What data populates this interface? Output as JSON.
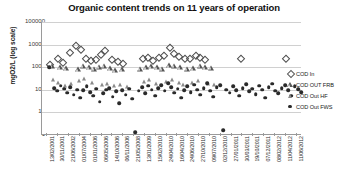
{
  "chart_data": {
    "type": "scatter",
    "title": "Organic content trends on 11 years of operation",
    "xlabel": "",
    "ylabel": "mgO2/L (log scale)",
    "yscale": "log",
    "ylim": [
      1,
      100000
    ],
    "ytick_labels": [
      "100000",
      "10000",
      "1000",
      "100",
      "10",
      "1"
    ],
    "ytick_values": [
      100000,
      10000,
      1000,
      100,
      10,
      1
    ],
    "grid": true,
    "legend_position": "right",
    "categories": [
      "13/02/2001",
      "30/11/2001",
      "21/06/2002",
      "01/07/2004",
      "01/01/2006",
      "06/05/2006",
      "14/10/2006",
      "06/11/2006",
      "21/05/2008",
      "13/01/2009",
      "15/02/2010",
      "24/04/2010",
      "16/04/2010",
      "24/06/2010",
      "27/10/2010",
      "09/07/2010",
      "02/12/2010",
      "27/01/2011",
      "30/03/2011",
      "19/10/2011",
      "07/12/2011",
      "08/02/2012",
      "11/04/2012",
      "11/06/2012"
    ],
    "series": [
      {
        "name": "COD In",
        "marker": "open-diamond",
        "color": "#4d4d4d",
        "points": [
          {
            "x": 1.0,
            "y": 1200
          },
          {
            "x": 2.0,
            "y": 2300
          },
          {
            "x": 2.6,
            "y": 1500
          },
          {
            "x": 3.4,
            "y": 4200
          },
          {
            "x": 4.2,
            "y": 9000
          },
          {
            "x": 4.8,
            "y": 6000
          },
          {
            "x": 5.4,
            "y": 2400
          },
          {
            "x": 6.0,
            "y": 1800
          },
          {
            "x": 6.6,
            "y": 2000
          },
          {
            "x": 7.2,
            "y": 3400
          },
          {
            "x": 7.8,
            "y": 5200
          },
          {
            "x": 8.6,
            "y": 2100
          },
          {
            "x": 9.4,
            "y": 1700
          },
          {
            "x": 10.0,
            "y": 1450
          },
          {
            "x": 12.4,
            "y": 2200
          },
          {
            "x": 13.0,
            "y": 2600
          },
          {
            "x": 13.6,
            "y": 1900
          },
          {
            "x": 14.4,
            "y": 2500
          },
          {
            "x": 15.0,
            "y": 3100
          },
          {
            "x": 15.8,
            "y": 7000
          },
          {
            "x": 16.3,
            "y": 4000
          },
          {
            "x": 16.9,
            "y": 2800
          },
          {
            "x": 17.6,
            "y": 2400
          },
          {
            "x": 18.2,
            "y": 2200
          },
          {
            "x": 19.0,
            "y": 3000
          },
          {
            "x": 19.5,
            "y": 2600
          },
          {
            "x": 20.1,
            "y": 2100
          },
          {
            "x": 24.5,
            "y": 2300
          },
          {
            "x": 30.0,
            "y": 2300
          }
        ]
      },
      {
        "name": "COD OUT FRB",
        "marker": "open-triangle",
        "color": "#555555",
        "points": [
          {
            "x": 1.2,
            "y": 700
          },
          {
            "x": 2.2,
            "y": 620
          },
          {
            "x": 3.0,
            "y": 560
          },
          {
            "x": 4.4,
            "y": 480
          },
          {
            "x": 5.0,
            "y": 700
          },
          {
            "x": 5.8,
            "y": 600
          },
          {
            "x": 6.4,
            "y": 520
          },
          {
            "x": 7.0,
            "y": 640
          },
          {
            "x": 7.6,
            "y": 700
          },
          {
            "x": 8.4,
            "y": 560
          },
          {
            "x": 9.0,
            "y": 430
          },
          {
            "x": 9.8,
            "y": 500
          },
          {
            "x": 12.0,
            "y": 520
          },
          {
            "x": 12.8,
            "y": 600
          },
          {
            "x": 13.4,
            "y": 680
          },
          {
            "x": 14.2,
            "y": 620
          },
          {
            "x": 14.8,
            "y": 520
          },
          {
            "x": 15.6,
            "y": 760
          },
          {
            "x": 16.2,
            "y": 700
          },
          {
            "x": 17.0,
            "y": 600
          },
          {
            "x": 17.8,
            "y": 520
          },
          {
            "x": 18.6,
            "y": 560
          },
          {
            "x": 19.4,
            "y": 700
          },
          {
            "x": 20.0,
            "y": 620
          },
          {
            "x": 20.8,
            "y": 580
          }
        ]
      },
      {
        "name": "COD Out HF",
        "marker": "filled-triangle",
        "color": "#8a8a8a",
        "points": [
          {
            "x": 1.4,
            "y": 260
          },
          {
            "x": 2.0,
            "y": 200
          },
          {
            "x": 2.8,
            "y": 150
          },
          {
            "x": 3.6,
            "y": 180
          },
          {
            "x": 4.6,
            "y": 240
          },
          {
            "x": 5.2,
            "y": 300
          },
          {
            "x": 6.2,
            "y": 210
          },
          {
            "x": 7.4,
            "y": 170
          },
          {
            "x": 8.0,
            "y": 190
          },
          {
            "x": 8.8,
            "y": 140
          },
          {
            "x": 9.6,
            "y": 160
          },
          {
            "x": 10.4,
            "y": 130
          },
          {
            "x": 12.6,
            "y": 220
          },
          {
            "x": 13.2,
            "y": 260
          },
          {
            "x": 14.0,
            "y": 190
          },
          {
            "x": 15.2,
            "y": 230
          },
          {
            "x": 16.0,
            "y": 280
          },
          {
            "x": 16.8,
            "y": 200
          },
          {
            "x": 17.4,
            "y": 170
          },
          {
            "x": 18.4,
            "y": 210
          },
          {
            "x": 19.2,
            "y": 250
          },
          {
            "x": 20.4,
            "y": 180
          },
          {
            "x": 21.2,
            "y": 160
          }
        ]
      },
      {
        "name": "COD Out FWS",
        "marker": "filled-circle",
        "color": "#2a2a2a",
        "points": [
          {
            "x": 0.9,
            "y": 1000
          },
          {
            "x": 1.5,
            "y": 120
          },
          {
            "x": 1.9,
            "y": 90
          },
          {
            "x": 2.3,
            "y": 150
          },
          {
            "x": 2.7,
            "y": 110
          },
          {
            "x": 3.1,
            "y": 75
          },
          {
            "x": 3.5,
            "y": 130
          },
          {
            "x": 3.9,
            "y": 60
          },
          {
            "x": 4.3,
            "y": 100
          },
          {
            "x": 4.7,
            "y": 45
          },
          {
            "x": 5.1,
            "y": 95
          },
          {
            "x": 5.5,
            "y": 140
          },
          {
            "x": 5.9,
            "y": 80
          },
          {
            "x": 6.3,
            "y": 55
          },
          {
            "x": 6.7,
            "y": 110
          },
          {
            "x": 7.1,
            "y": 30
          },
          {
            "x": 7.5,
            "y": 70
          },
          {
            "x": 7.9,
            "y": 100
          },
          {
            "x": 8.3,
            "y": 120
          },
          {
            "x": 8.7,
            "y": 50
          },
          {
            "x": 9.1,
            "y": 85
          },
          {
            "x": 9.5,
            "y": 25
          },
          {
            "x": 9.9,
            "y": 95
          },
          {
            "x": 10.3,
            "y": 60
          },
          {
            "x": 10.7,
            "y": 110
          },
          {
            "x": 11.1,
            "y": 40
          },
          {
            "x": 11.5,
            "y": 1.3
          },
          {
            "x": 11.9,
            "y": 90
          },
          {
            "x": 12.3,
            "y": 130
          },
          {
            "x": 12.7,
            "y": 70
          },
          {
            "x": 13.1,
            "y": 150
          },
          {
            "x": 13.5,
            "y": 100
          },
          {
            "x": 13.9,
            "y": 55
          },
          {
            "x": 14.3,
            "y": 120
          },
          {
            "x": 14.7,
            "y": 160
          },
          {
            "x": 15.1,
            "y": 90
          },
          {
            "x": 15.5,
            "y": 200
          },
          {
            "x": 15.9,
            "y": 130
          },
          {
            "x": 16.3,
            "y": 75
          },
          {
            "x": 16.7,
            "y": 110
          },
          {
            "x": 17.1,
            "y": 45
          },
          {
            "x": 17.5,
            "y": 95
          },
          {
            "x": 17.9,
            "y": 140
          },
          {
            "x": 18.3,
            "y": 80
          },
          {
            "x": 18.7,
            "y": 170
          },
          {
            "x": 19.1,
            "y": 100
          },
          {
            "x": 19.5,
            "y": 60
          },
          {
            "x": 19.9,
            "y": 120
          },
          {
            "x": 20.3,
            "y": 200
          },
          {
            "x": 20.7,
            "y": 90
          },
          {
            "x": 21.1,
            "y": 50
          },
          {
            "x": 21.5,
            "y": 130
          },
          {
            "x": 21.9,
            "y": 160
          },
          {
            "x": 22.3,
            "y": 1.6
          },
          {
            "x": 22.7,
            "y": 100
          },
          {
            "x": 23.1,
            "y": 75
          },
          {
            "x": 23.5,
            "y": 140
          },
          {
            "x": 23.9,
            "y": 95
          },
          {
            "x": 24.3,
            "y": 55
          },
          {
            "x": 24.7,
            "y": 120
          },
          {
            "x": 25.1,
            "y": 180
          },
          {
            "x": 25.5,
            "y": 85
          },
          {
            "x": 25.9,
            "y": 110
          },
          {
            "x": 26.3,
            "y": 65
          },
          {
            "x": 26.7,
            "y": 150
          },
          {
            "x": 27.1,
            "y": 100
          },
          {
            "x": 27.5,
            "y": 45
          },
          {
            "x": 27.9,
            "y": 130
          },
          {
            "x": 28.3,
            "y": 190
          },
          {
            "x": 28.7,
            "y": 90
          },
          {
            "x": 29.1,
            "y": 70
          },
          {
            "x": 29.5,
            "y": 120
          },
          {
            "x": 29.9,
            "y": 160
          },
          {
            "x": 30.3,
            "y": 95
          },
          {
            "x": 30.7,
            "y": 55
          },
          {
            "x": 31.1,
            "y": 140
          },
          {
            "x": 31.5,
            "y": 105
          },
          {
            "x": 31.9,
            "y": 80
          }
        ]
      }
    ]
  },
  "legend": {
    "items": [
      {
        "label": "COD In",
        "marker": "open-diamond"
      },
      {
        "label": "COD OUT FRB",
        "marker": "open-triangle"
      },
      {
        "label": "COD Out HF",
        "marker": "filled-triangle"
      },
      {
        "label": "COD Out FWS",
        "marker": "filled-circle"
      }
    ]
  }
}
